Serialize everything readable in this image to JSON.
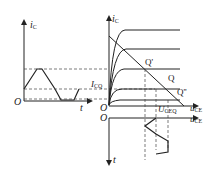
{
  "diagram": {
    "type": "transistor output characteristics with load line and waveform projection",
    "left_plot": {
      "y_axis_label": {
        "main": "i",
        "sub": "C"
      },
      "x_axis_label": "t",
      "origin_label": "O",
      "waveform": "i_C vs t, sinusoid with bottom clipped flat"
    },
    "right_plot": {
      "y_axis_label": {
        "main": "i",
        "sub": "C"
      },
      "x_axis_label": {
        "main": "u",
        "sub": "CE"
      },
      "origin_label": "O",
      "icq_label": {
        "main": "I",
        "sub": "CQ"
      },
      "points": [
        {
          "label": "Q'"
        },
        {
          "label": "Q"
        },
        {
          "label": "Q''"
        }
      ],
      "curve_count": 5
    },
    "bottom_plot": {
      "x_axis_label": {
        "main": "u",
        "sub": "CE"
      },
      "y_axis_label": "t",
      "origin_label": "O",
      "uceq_label": {
        "main": "U",
        "sub": "CEQ"
      },
      "waveform": "u_CE vs t, sinusoid with one side clipped flat"
    },
    "colors": {
      "line": "#222222",
      "dash": "#444444",
      "background": "#ffffff"
    }
  }
}
